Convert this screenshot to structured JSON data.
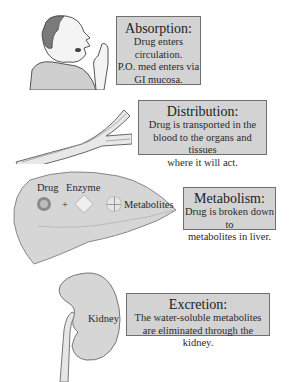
{
  "stages": [
    {
      "id": "absorption",
      "title": "Absorption:",
      "lines": [
        "Drug enters",
        "circulation.",
        "P.O. med enters via",
        "GI mucosa."
      ],
      "illustration": "man-taking-pill-icon"
    },
    {
      "id": "distribution",
      "title": "Distribution:",
      "lines": [
        "Drug is transported in the",
        "blood to the organs and tissues",
        "where it will act."
      ],
      "illustration": "blood-vessel-icon"
    },
    {
      "id": "metabolism",
      "title": "Metabolism:",
      "lines": [
        "Drug is broken down to",
        "metabolites in liver."
      ],
      "illustration": "liver-icon",
      "labels": {
        "drug": "Drug",
        "enzyme": "Enzyme",
        "plus": "+",
        "metabolites": "Metabolites"
      }
    },
    {
      "id": "excretion",
      "title": "Excretion:",
      "lines": [
        "The water-soluble metabolites",
        "are eliminated through the kidney."
      ],
      "illustration": "kidney-icon",
      "labels": {
        "kidney": "Kidney"
      }
    }
  ],
  "colors": {
    "box_fill": "#d3d3d3",
    "box_border": "#6f6f6f",
    "organ_fill": "#d6d6d6"
  }
}
